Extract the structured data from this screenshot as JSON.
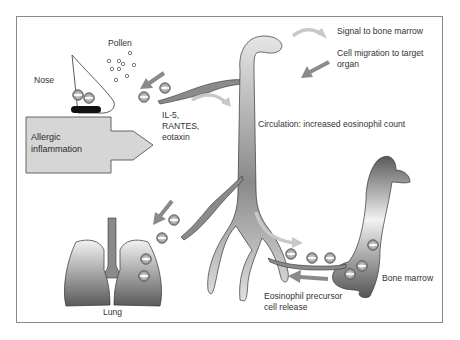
{
  "diagram": {
    "labels": {
      "nose": "Nose",
      "pollen": "Pollen",
      "allergic_line1": "Allergic",
      "allergic_line2": "inflammation",
      "cytokines_line1": "IL-5,",
      "cytokines_line2": "RANTES,",
      "cytokines_line3": "eotaxin",
      "circulation": "Circulation: increased eosinophil count",
      "bone_marrow": "Bone marrow",
      "release_line1": "Eosinophil precursor",
      "release_line2": "cell release",
      "lung": "Lung"
    },
    "legend": [
      {
        "icon": "curved-arrow-icon",
        "color": "#c8c8c8",
        "label": "Signal to bone marrow"
      },
      {
        "icon": "straight-arrow-icon",
        "color": "#8a8a8a",
        "label_line1": "Cell migration to target",
        "label_line2": "organ"
      }
    ],
    "colors": {
      "frame": "#8a8a8a",
      "signal_arrow": "#c8c8c8",
      "migration_arrow": "#8a8a8a",
      "tissue_dark": "#5c5c5c",
      "tissue_light": "#f2f2f2",
      "box_fill": "#d6d6d6"
    }
  }
}
